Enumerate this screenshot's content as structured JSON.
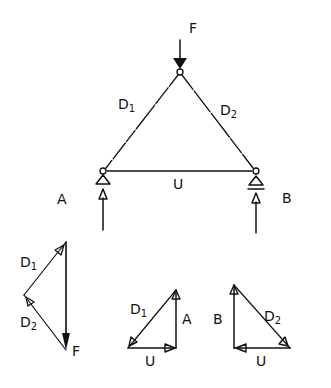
{
  "diagram": {
    "truss": {
      "load_label": "F",
      "member_left_label": "D",
      "member_left_sub": "1",
      "member_right_label": "D",
      "member_right_sub": "2",
      "member_bottom_label": "U",
      "support_left_label": "A",
      "support_right_label": "B",
      "nodes": {
        "top": [
          180,
          72
        ],
        "left": [
          103,
          172
        ],
        "right": [
          256,
          172
        ]
      }
    },
    "force_polygon_node_F": {
      "labels": {
        "d1": "D",
        "d1_sub": "1",
        "d2": "D",
        "d2_sub": "2",
        "f": "F"
      },
      "vertices": {
        "top": [
          66,
          242
        ],
        "left": [
          24,
          295
        ],
        "bottom": [
          66,
          350
        ]
      }
    },
    "force_triangle_A": {
      "labels": {
        "d1": "D",
        "d1_sub": "1",
        "a": "A",
        "u": "U"
      },
      "vertices": {
        "top": [
          176,
          290
        ],
        "bottom_left": [
          128,
          348
        ],
        "bottom_right": [
          176,
          348
        ]
      }
    },
    "force_triangle_B": {
      "labels": {
        "b": "B",
        "d2": "D",
        "d2_sub": "2",
        "u": "U"
      },
      "vertices": {
        "top": [
          234,
          285
        ],
        "bottom_left": [
          234,
          348
        ],
        "bottom_right": [
          290,
          348
        ]
      }
    },
    "colors": {
      "ink": "#111111",
      "background": "#ffffff"
    }
  }
}
